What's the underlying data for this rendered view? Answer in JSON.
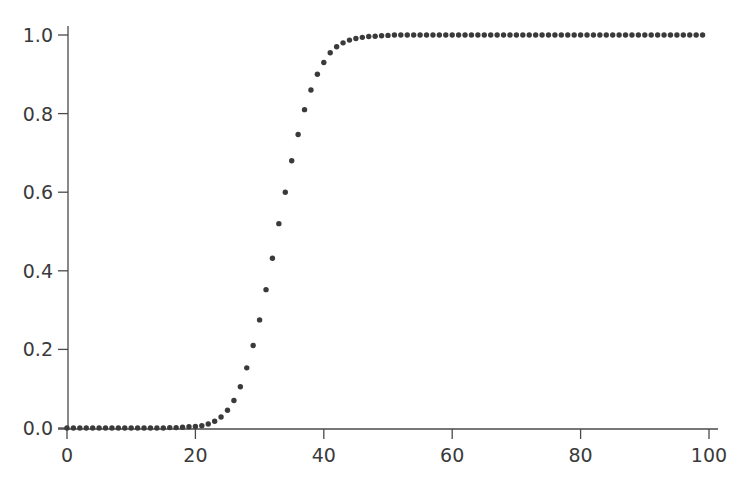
{
  "chart_data": {
    "type": "scatter",
    "title": "",
    "xlabel": "",
    "ylabel": "",
    "xlim": [
      0,
      100
    ],
    "ylim": [
      0.0,
      1.0
    ],
    "grid": false,
    "legend": null,
    "x_ticks": [
      "0",
      "20",
      "40",
      "60",
      "80",
      "100"
    ],
    "y_ticks": [
      "0.0",
      "0.2",
      "0.4",
      "0.6",
      "0.8",
      "1.0"
    ],
    "marker_color": "#3a3a3a",
    "series": [
      {
        "name": "sigmoid",
        "x": [
          0,
          1,
          2,
          3,
          4,
          5,
          6,
          7,
          8,
          9,
          10,
          11,
          12,
          13,
          14,
          15,
          16,
          17,
          18,
          19,
          20,
          21,
          22,
          23,
          24,
          25,
          26,
          27,
          28,
          29,
          30,
          31,
          32,
          33,
          34,
          35,
          36,
          37,
          38,
          39,
          40,
          41,
          42,
          43,
          44,
          45,
          46,
          47,
          48,
          49,
          50,
          51,
          52,
          53,
          54,
          55,
          56,
          57,
          58,
          59,
          60,
          61,
          62,
          63,
          64,
          65,
          66,
          67,
          68,
          69,
          70,
          71,
          72,
          73,
          74,
          75,
          76,
          77,
          78,
          79,
          80,
          81,
          82,
          83,
          84,
          85,
          86,
          87,
          88,
          89,
          90,
          91,
          92,
          93,
          94,
          95,
          96,
          97,
          98,
          99
        ],
        "values": [
          0.0,
          0.0,
          0.0,
          0.0,
          0.0,
          0.0,
          0.0,
          0.0,
          0.0,
          0.0,
          0.0,
          0.0,
          0.0,
          0.0,
          0.0,
          0.0,
          0.001,
          0.001,
          0.002,
          0.003,
          0.004,
          0.006,
          0.01,
          0.017,
          0.028,
          0.045,
          0.07,
          0.105,
          0.153,
          0.21,
          0.275,
          0.352,
          0.432,
          0.52,
          0.6,
          0.68,
          0.747,
          0.81,
          0.86,
          0.9,
          0.93,
          0.955,
          0.97,
          0.98,
          0.987,
          0.991,
          0.994,
          0.996,
          0.997,
          0.998,
          0.999,
          1.0,
          1.0,
          1.0,
          1.0,
          1.0,
          1.0,
          1.0,
          1.0,
          1.0,
          1.0,
          1.0,
          1.0,
          1.0,
          1.0,
          1.0,
          1.0,
          1.0,
          1.0,
          1.0,
          1.0,
          1.0,
          1.0,
          1.0,
          1.0,
          1.0,
          1.0,
          1.0,
          1.0,
          1.0,
          1.0,
          1.0,
          1.0,
          1.0,
          1.0,
          1.0,
          1.0,
          1.0,
          1.0,
          1.0,
          1.0,
          1.0,
          1.0,
          1.0,
          1.0,
          1.0,
          1.0,
          1.0,
          1.0,
          1.0
        ]
      }
    ]
  }
}
